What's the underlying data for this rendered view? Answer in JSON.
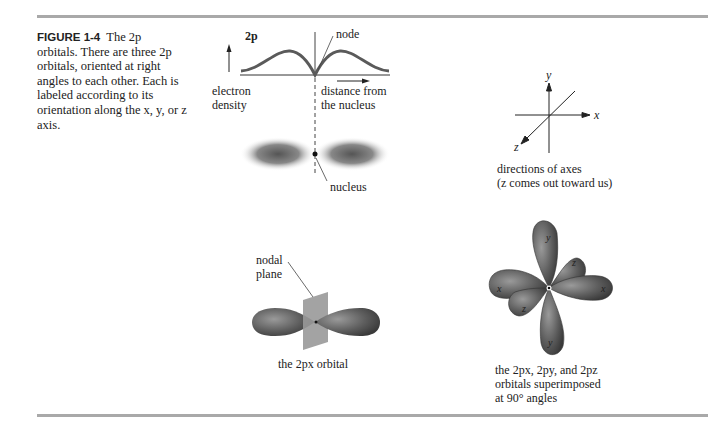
{
  "figure": {
    "label": "FIGURE 1-4",
    "caption_lines": [
      "The 2p",
      "orbitals. There are three 2p",
      "orbitals, oriented at right",
      "angles to each other. Each is",
      "labeled according to its",
      "orientation along the x, y, or z",
      "axis."
    ]
  },
  "density_plot": {
    "title": "2p",
    "y_label_1": "electron",
    "y_label_2": "density",
    "x_label_1": "distance from",
    "x_label_2": "the nucleus",
    "node_label": "node",
    "nucleus_label": "nucleus"
  },
  "axes_diagram": {
    "x": "x",
    "y": "y",
    "z": "z",
    "caption_1": "directions of axes",
    "caption_2": "(z comes out toward us)"
  },
  "px_orbital": {
    "plane_label_1": "nodal",
    "plane_label_2": "plane",
    "caption": "the 2px orbital"
  },
  "superimposed": {
    "lobe_labels": [
      "y",
      "z",
      "x",
      "x",
      "z",
      "y"
    ],
    "caption_1": "the 2px, 2py, and 2pz",
    "caption_2": "orbitals superimposed",
    "caption_3": "at 90° angles"
  }
}
